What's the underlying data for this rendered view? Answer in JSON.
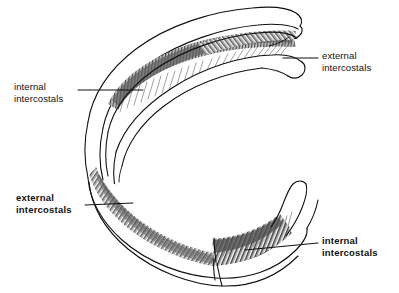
{
  "figure": {
    "background_color": "#ffffff",
    "ink_color": "#111111",
    "muscle_shade_color": "#6b6b6b"
  },
  "labels": {
    "internal_top": {
      "line1": "internal",
      "line2": "intercostals",
      "weight": "regular"
    },
    "external_top": {
      "line1": "external",
      "line2": "intercostals",
      "weight": "regular"
    },
    "external_bottom": {
      "line1": "external",
      "line2": "intercostals",
      "weight": "bold"
    },
    "internal_bottom": {
      "line1": "internal",
      "line2": "intercostals",
      "weight": "bold"
    }
  },
  "leader_lines": {
    "internal_top": {
      "x1": 78,
      "y1": 90,
      "x2": 143,
      "y2": 90
    },
    "external_top": {
      "x1": 283,
      "y1": 58,
      "x2": 318,
      "y2": 58
    },
    "external_bottom": {
      "x1": 85,
      "y1": 205,
      "x2": 133,
      "y2": 203
    },
    "internal_bottom": {
      "x1": 245,
      "y1": 250,
      "x2": 318,
      "y2": 243
    }
  }
}
